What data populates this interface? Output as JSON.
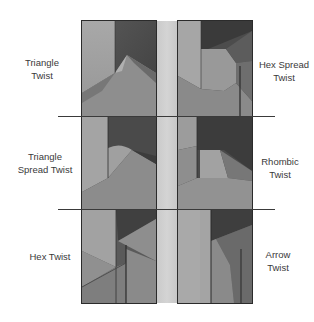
{
  "figure": {
    "labels": {
      "left": [
        {
          "line1": "Triangle",
          "line2": "Twist"
        },
        {
          "line1": "Triangle",
          "line2": "Spread Twist"
        },
        {
          "line1": "Hex Twist",
          "line2": ""
        }
      ],
      "right": [
        {
          "line1": "Hex Spread",
          "line2": "Twist"
        },
        {
          "line1": "Rhombic",
          "line2": "Twist"
        },
        {
          "line1": "Arrow",
          "line2": "Twist"
        }
      ]
    },
    "panels": [
      {
        "id": "triangle-twist",
        "row": 1,
        "side": "left"
      },
      {
        "id": "hex-spread-twist",
        "row": 1,
        "side": "right"
      },
      {
        "id": "triangle-spread-twist",
        "row": 2,
        "side": "left"
      },
      {
        "id": "rhombic-twist",
        "row": 2,
        "side": "right"
      },
      {
        "id": "hex-twist",
        "row": 3,
        "side": "left"
      },
      {
        "id": "arrow-twist",
        "row": 3,
        "side": "right"
      }
    ],
    "colors": {
      "background": "#ffffff",
      "frame": "#2b2b2b",
      "divider": "#3a3a3a",
      "text": "#3a3a3a",
      "strip": "#cfcfcf"
    }
  }
}
